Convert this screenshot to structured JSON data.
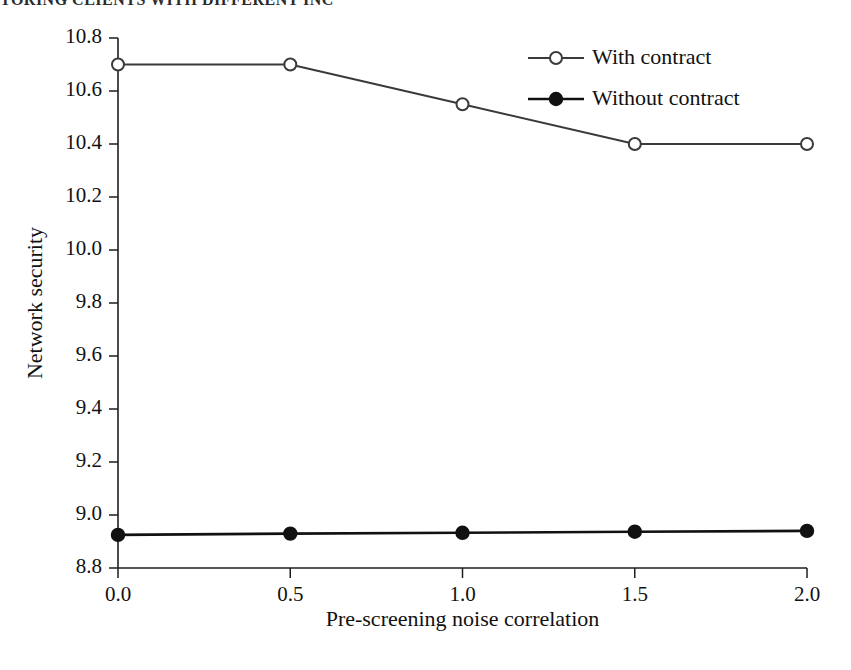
{
  "running_head": "TORING CLIENTS WITH DIFFERENT INC",
  "chart_data": {
    "type": "line",
    "title": "",
    "xlabel": "Pre-screening noise correlation",
    "ylabel": "Network security",
    "x": [
      0.0,
      0.5,
      1.0,
      1.5,
      2.0
    ],
    "xtick_labels": [
      "0.0",
      "0.5",
      "1.0",
      "1.5",
      "2.0"
    ],
    "ytick_labels": [
      "8.8",
      "9.0",
      "9.2",
      "9.4",
      "9.6",
      "9.8",
      "10.0",
      "10.2",
      "10.4",
      "10.6",
      "10.8"
    ],
    "yticks": [
      8.8,
      9.0,
      9.2,
      9.4,
      9.6,
      9.8,
      10.0,
      10.2,
      10.4,
      10.6,
      10.8
    ],
    "xlim": [
      0.0,
      2.0
    ],
    "ylim": [
      8.8,
      10.8
    ],
    "grid": false,
    "legend_position": "top-right",
    "series": [
      {
        "name": "With contract",
        "marker": "open-circle",
        "color": "#3a3a3a",
        "values": [
          10.7,
          10.7,
          10.55,
          10.4,
          10.4
        ]
      },
      {
        "name": "Without contract",
        "marker": "filled-circle",
        "color": "#111111",
        "values": [
          8.925,
          8.93,
          8.933,
          8.937,
          8.94
        ]
      }
    ]
  }
}
